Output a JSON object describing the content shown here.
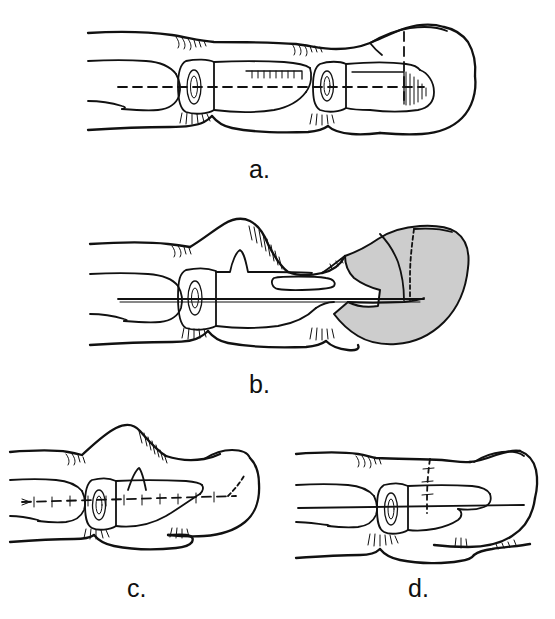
{
  "figure": {
    "kind": "surgical-technique-line-drawing",
    "background_color": "#ffffff",
    "ink_color": "#111111",
    "flap_shade_color": "#cdcdcd",
    "panel_count": 4
  },
  "panels": [
    {
      "id": "a",
      "label": "a.",
      "label_position": {
        "x": 249,
        "y": 157
      },
      "description": "Lateral view of intact finger with dashed longitudinal axis through the phalanges and dashed vertical line at the nail bed marking the level of amputation.",
      "markings": {
        "longitudinal_axis": "dashed",
        "distal_vertical_line": "dashed",
        "shaded_flap": false
      }
    },
    {
      "id": "b",
      "label": "b.",
      "label_position": {
        "x": 249,
        "y": 372
      },
      "description": "Finger in flexion with dorsal hump, intramedullary wire shown as solid line, and a shaded volar pulp flap elevated at the fingertip with dashed outline of the planned advancement.",
      "markings": {
        "longitudinal_axis": "solid-wire",
        "distal_vertical_line": "dashed",
        "shaded_flap": true
      }
    },
    {
      "id": "c",
      "label": "c.",
      "label_position": {
        "x": 127,
        "y": 576
      },
      "description": "Shortened finger after bone resection, with a transfixing K-wire drawn as a tick-marked dashed line running the full length of the digit.",
      "markings": {
        "longitudinal_axis": "dashed-with-ticks",
        "distal_vertical_line": false,
        "shaded_flap": false
      }
    },
    {
      "id": "d",
      "label": "d.",
      "label_position": {
        "x": 408,
        "y": 576
      },
      "description": "Final healed result with rounded fingertip contour, solid longitudinal axis and a vertical dashed suture line over the dorsum.",
      "markings": {
        "longitudinal_axis": "solid",
        "distal_vertical_line": "dashed-suture",
        "shaded_flap": false
      }
    }
  ]
}
